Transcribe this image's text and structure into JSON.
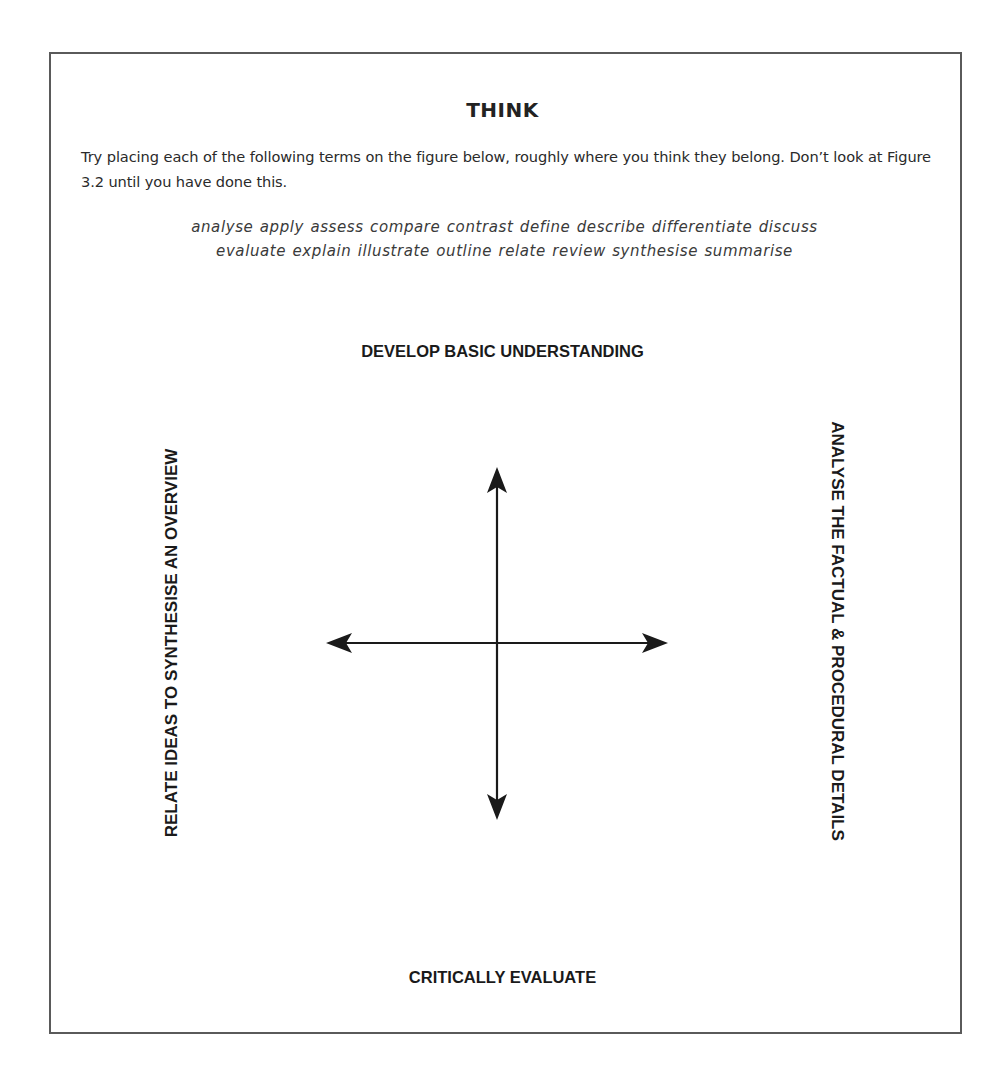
{
  "panel": {
    "title": "THINK",
    "instructions": "Try placing each of the following terms on the figure below, roughly where you think they belong. Don’t look at Figure 3.2 until you have done this.",
    "terms_lines": [
      "analyse apply assess compare contrast define describe differentiate discuss",
      "evaluate explain illustrate outline relate review synthesise summarise"
    ],
    "terms": [
      "analyse",
      "apply",
      "assess",
      "compare",
      "contrast",
      "define",
      "describe",
      "differentiate",
      "discuss",
      "evaluate",
      "explain",
      "illustrate",
      "outline",
      "relate",
      "review",
      "synthesise",
      "summarise"
    ]
  },
  "figure": {
    "axis_labels": {
      "top": "DEVELOP BASIC UNDERSTANDING",
      "bottom": "CRITICALLY EVALUATE",
      "left": "RELATE IDEAS TO SYNTHESISE AN OVERVIEW",
      "right": "ANALYSE THE FACTUAL & PROCEDURAL DETAILS"
    },
    "arrows": {
      "center": [
        497,
        643
      ],
      "up_tip": [
        497,
        467
      ],
      "down_tip": [
        497,
        820
      ],
      "left_tip": [
        326,
        643
      ],
      "right_tip": [
        668,
        643
      ]
    },
    "colors": {
      "border": "#5a5a5a",
      "arrow": "#1a1a1a",
      "text": "#222222"
    }
  }
}
